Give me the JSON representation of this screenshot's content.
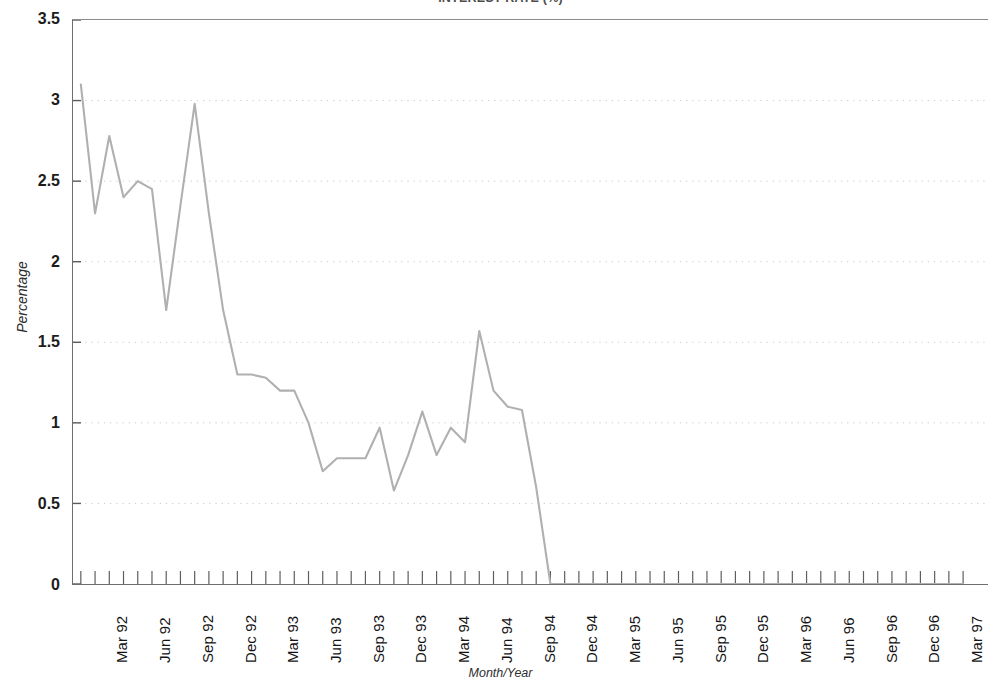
{
  "chart_data": {
    "type": "line",
    "title": "INTEREST RATE (%)",
    "xlabel": "Month/Year",
    "ylabel": "Percentage",
    "ylim": [
      0,
      3.5
    ],
    "ytick_values": [
      0,
      0.5,
      1,
      1.5,
      2,
      2.5,
      3,
      3.5
    ],
    "ytick_labels": [
      "0",
      "0.5",
      "1",
      "1.5",
      "2",
      "2.5",
      "3",
      "3.5"
    ],
    "grid": "horizontal-dotted",
    "legend": "none",
    "line_color": "#b0b0b0",
    "categories": [
      "Jan 92",
      "Feb 92",
      "Mar 92",
      "Apr 92",
      "May 92",
      "Jun 92",
      "Jul 92",
      "Aug 92",
      "Sep 92",
      "Oct 92",
      "Nov 92",
      "Dec 92",
      "Jan 93",
      "Feb 93",
      "Mar 93",
      "Apr 93",
      "May 93",
      "Jun 93",
      "Jul 93",
      "Aug 93",
      "Sep 93",
      "Oct 93",
      "Nov 93",
      "Dec 93",
      "Jan 94",
      "Feb 94",
      "Mar 94",
      "Apr 94",
      "May 94",
      "Jun 94",
      "Jul 94",
      "Aug 94",
      "Sep 94",
      "Oct 94",
      "Nov 94",
      "Dec 94",
      "Jan 95",
      "Feb 95",
      "Mar 95",
      "Apr 95",
      "May 95",
      "Jun 95",
      "Jul 95",
      "Aug 95",
      "Sep 95",
      "Oct 95",
      "Nov 95",
      "Dec 95",
      "Jan 96",
      "Feb 96",
      "Mar 96",
      "Apr 96",
      "May 96",
      "Jun 96",
      "Jul 96",
      "Aug 96",
      "Sep 96",
      "Oct 96",
      "Nov 96",
      "Dec 96",
      "Jan 97",
      "Feb 97",
      "Mar 97"
    ],
    "values": [
      3.1,
      2.3,
      2.78,
      2.4,
      2.5,
      2.45,
      1.7,
      2.35,
      2.98,
      2.3,
      1.7,
      1.3,
      1.3,
      1.28,
      1.2,
      1.2,
      1.0,
      0.7,
      0.78,
      0.78,
      0.78,
      0.97,
      0.58,
      0.8,
      1.07,
      0.8,
      0.97,
      0.88,
      1.57,
      1.2,
      1.1,
      1.08,
      0.6,
      0.0,
      0.0,
      0.0,
      0.0,
      0.0,
      0.0,
      0.0,
      0.0,
      0.0,
      0.0,
      0.0,
      0.0,
      0.0,
      0.0,
      0.0,
      0.0,
      0.0,
      0.0,
      0.0,
      0.0,
      0.0,
      0.0,
      0.0,
      0.0,
      0.0,
      0.0,
      0.0,
      0.0,
      0.0,
      0.0
    ],
    "xtick_labels": [
      "Mar 92",
      "Jun 92",
      "Sep 92",
      "Dec 92",
      "Mar 93",
      "Jun 93",
      "Sep 93",
      "Dec 93",
      "Mar 94",
      "Jun 94",
      "Sep 94",
      "Dec 94",
      "Mar 95",
      "Jun 95",
      "Sep 95",
      "Dec 95",
      "Mar 96",
      "Jun 96",
      "Sep 96",
      "Dec 96",
      "Mar 97"
    ]
  }
}
